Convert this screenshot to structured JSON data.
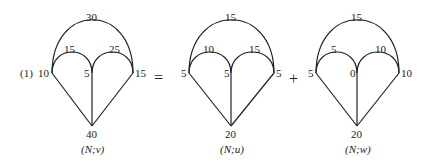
{
  "prefix": "(1)",
  "operators": {
    "equals": "=",
    "plus": "+"
  },
  "graphs": [
    {
      "caption": "(N;v)",
      "top_arc": "30",
      "left_arc": "15",
      "right_arc": "25",
      "left_node": "10",
      "middle_node": "5",
      "right_node": "15",
      "bottom_node": "40"
    },
    {
      "caption": "(N;u)",
      "top_arc": "15",
      "left_arc": "10",
      "right_arc": "15",
      "left_node": "5",
      "middle_node": "5",
      "right_node": "5",
      "bottom_node": "20"
    },
    {
      "caption": "(N;w)",
      "top_arc": "15",
      "left_arc": "5",
      "right_arc": "10",
      "left_node": "5",
      "middle_node": "0",
      "right_node": "10",
      "bottom_node": "20"
    }
  ]
}
